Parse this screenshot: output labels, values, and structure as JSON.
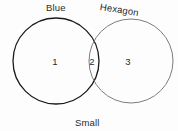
{
  "figure": {
    "type": "venn-diagram",
    "background_color": "#fdfdfd",
    "sets": [
      {
        "key": "left",
        "label": "Blue",
        "stroke_color": "#1a1a1a",
        "stroke_width": 1.3,
        "center_x": 56,
        "center_y": 61,
        "radius": 43
      },
      {
        "key": "right",
        "label": "Hexagon",
        "stroke_color": "#7d7d7d",
        "stroke_width": 1.0,
        "center_x": 131,
        "center_y": 61,
        "radius": 42
      }
    ],
    "caption": "Small",
    "regions": [
      {
        "key": "left_only",
        "value": "1"
      },
      {
        "key": "intersection",
        "value": "2"
      },
      {
        "key": "right_only",
        "value": "3"
      }
    ]
  },
  "chart_data": {
    "type": "venn",
    "title": "",
    "set_labels": [
      "Blue",
      "Hexagon"
    ],
    "caption_label": "Small",
    "regions": {
      "left_only": 1,
      "intersection": 2,
      "right_only": 3
    },
    "categories": [
      "Blue only",
      "Blue and Hexagon",
      "Hexagon only"
    ],
    "values": [
      1,
      2,
      3
    ],
    "legend": "none",
    "grid": false
  }
}
